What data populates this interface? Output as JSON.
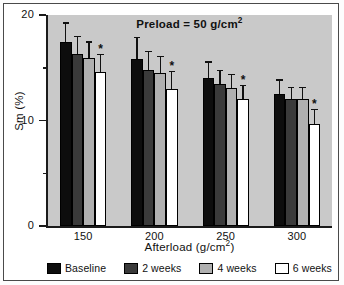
{
  "chart_data": {
    "type": "bar",
    "title": "Preload = 50 g/cm2",
    "title_base": "Preload = 50 g/cm",
    "title_sup": "2",
    "xlabel_base": "Afterload (g/cm",
    "xlabel_sup": "2",
    "xlabel_close": ")",
    "xlabel": "Afterload (g/cm2)",
    "ylabel": "Sm (%)",
    "categories": [
      "150",
      "200",
      "250",
      "300"
    ],
    "ylim": [
      0,
      20
    ],
    "yticks_major": [
      "20",
      "10",
      "0"
    ],
    "yticks_major_values": [
      20,
      10,
      0
    ],
    "yticks_minor_values": [
      15,
      5
    ],
    "grid": false,
    "legend_position": "bottom",
    "significance_marker": "*",
    "series": [
      {
        "name": "Baseline",
        "color": "#0d0d0d",
        "values": [
          17.4,
          15.8,
          14.0,
          12.5
        ],
        "errors": [
          1.9,
          2.1,
          1.6,
          1.4
        ],
        "significant": [
          false,
          false,
          false,
          false
        ]
      },
      {
        "name": "2 weeks",
        "color": "#3a3a3a",
        "values": [
          16.3,
          14.8,
          13.5,
          12.0
        ],
        "errors": [
          1.7,
          1.8,
          1.3,
          1.2
        ],
        "significant": [
          false,
          false,
          false,
          false
        ]
      },
      {
        "name": "4 weeks",
        "color": "#b0b0b0",
        "values": [
          15.9,
          14.5,
          13.1,
          12.0
        ],
        "errors": [
          1.6,
          1.6,
          1.3,
          1.2
        ],
        "significant": [
          false,
          false,
          false,
          false
        ]
      },
      {
        "name": "6 weeks",
        "color": "#ffffff",
        "values": [
          14.6,
          13.0,
          12.0,
          9.7
        ],
        "errors": [
          1.7,
          1.7,
          1.4,
          1.4
        ],
        "significant": [
          true,
          true,
          true,
          true
        ]
      }
    ]
  },
  "legend": {
    "items": [
      {
        "label": "Baseline"
      },
      {
        "label": "2 weeks"
      },
      {
        "label": "4 weeks"
      },
      {
        "label": "6 weeks"
      }
    ]
  }
}
